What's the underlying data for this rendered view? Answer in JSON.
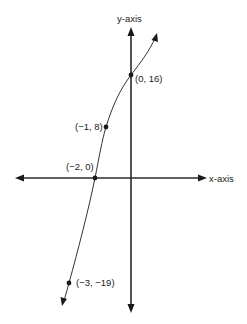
{
  "diagram": {
    "type": "function-graph",
    "axes": {
      "x_label": "x-axis",
      "y_label": "y-axis"
    },
    "points": [
      {
        "label": "(0, 16)",
        "x": 0,
        "y": 16
      },
      {
        "label": "(−1, 8)",
        "x": -1,
        "y": 8
      },
      {
        "label": "(−2, 0)",
        "x": -2,
        "y": 0
      },
      {
        "label": "(−3, −19)",
        "x": -3,
        "y": -19
      }
    ],
    "colors": {
      "axis": "#2a2a2a",
      "curve": "#333333",
      "background": "#ffffff"
    }
  }
}
